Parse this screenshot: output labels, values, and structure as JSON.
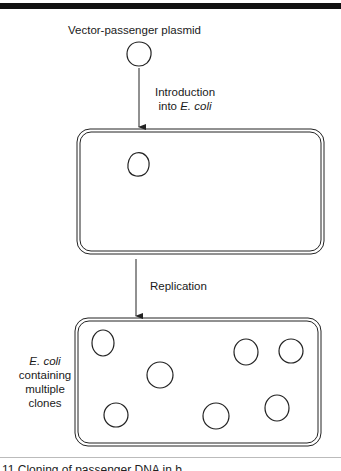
{
  "figure": {
    "title": "Vector-passenger plasmid",
    "step1": {
      "line1": "Introduction",
      "line2_prefix": "into ",
      "line2_italic": "E. coli"
    },
    "step2": {
      "label": "Replication"
    },
    "side_label": {
      "line1_italic": "E. coli",
      "line2": "containing",
      "line3": "multiple",
      "line4": "clones"
    },
    "caption_partial": "11  Cloning of passenger DNA in b"
  },
  "shapes": {
    "top_plasmid": {
      "cx": 139,
      "cy": 54,
      "r": 12
    },
    "cell1": {
      "x": 77,
      "y": 129,
      "w": 247,
      "h": 125,
      "plasmids": [
        {
          "cx": 139,
          "cy": 165,
          "r": 12
        }
      ]
    },
    "cell2": {
      "x": 75,
      "y": 318,
      "w": 246,
      "h": 128,
      "plasmids": [
        {
          "cx": 103,
          "cy": 343,
          "r": 12
        },
        {
          "cx": 160,
          "cy": 375,
          "r": 13
        },
        {
          "cx": 246,
          "cy": 352,
          "r": 12
        },
        {
          "cx": 291,
          "cy": 351,
          "r": 12
        },
        {
          "cx": 116,
          "cy": 415,
          "r": 12
        },
        {
          "cx": 216,
          "cy": 416,
          "r": 12
        },
        {
          "cx": 277,
          "cy": 408,
          "r": 12
        }
      ]
    },
    "arrows": [
      {
        "x": 139,
        "y1": 68,
        "y2": 127
      },
      {
        "x": 136,
        "y1": 259,
        "y2": 316
      }
    ],
    "stroke_color": "#222222"
  }
}
